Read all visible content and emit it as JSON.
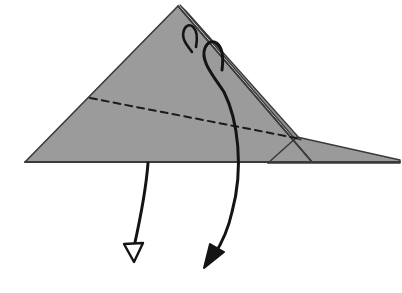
{
  "figure": {
    "type": "origami-fold-diagram",
    "canvas": {
      "width": 402,
      "height": 293
    },
    "background_color": "#ffffff"
  },
  "palette": {
    "paper_fill": "#9b9b9b",
    "paper_fill_flap": "#9a9a9a",
    "paper_fill_sliver": "#8c8c8c",
    "edge_stroke": "#3a3a3a",
    "crease_stroke": "#1a1a1a",
    "arrow_stroke": "#141414",
    "arrow_fill": "#141414",
    "background": "#ffffff"
  },
  "shapes": {
    "main_triangle": {
      "name": "Main folded triangle body",
      "points": "25,162 178,6 312,162",
      "fill_ref": "paper_fill",
      "stroke_ref": "edge_stroke",
      "stroke_width": 1.6
    },
    "right_flap": {
      "name": "Thin right-pointing flap layer",
      "points": "297,137 400,160 400,163 268,163",
      "fill_ref": "paper_fill_flap",
      "stroke_ref": "edge_stroke",
      "stroke_width": 1.4
    },
    "apex_sliver": {
      "name": "Narrow raised sliver along right upper edge",
      "points": "180,5 186,11 301,140 294,138",
      "fill_ref": "paper_fill_sliver",
      "stroke_ref": "edge_stroke",
      "stroke_width": 1.2
    }
  },
  "lines": {
    "baseline": {
      "name": "Bottom horizontal edge",
      "from": "25,162",
      "to": "400,162",
      "stroke_ref": "edge_stroke",
      "stroke_width": 1.8,
      "style": "solid"
    },
    "right_edge_fold": {
      "name": "Right edge fold line from apex to baseline",
      "from": "178,6",
      "to": "312,162",
      "stroke_ref": "edge_stroke",
      "stroke_width": 1.8,
      "style": "solid"
    },
    "flap_left_edge": {
      "name": "Left boundary of right flap",
      "from": "297,137",
      "to": "268,163",
      "stroke_ref": "edge_stroke",
      "stroke_width": 1.5,
      "style": "solid"
    },
    "crease_dashed": {
      "name": "Valley fold crease (dashed)",
      "from": "90,98",
      "to": "301,139",
      "stroke_ref": "crease_stroke",
      "stroke_width": 2.0,
      "style": "dashed",
      "dash_pattern": "7,5"
    }
  },
  "arrows": [
    {
      "id": "arrow-left-unfold",
      "name": "Left downward unfold arrow (hollow head)",
      "head_style": "hollow",
      "description": "Straight slightly curved arrow descending from the baseline down and to the left",
      "path": "M 148,163 C 146,190 140,220 134,247",
      "head_points": "134,262 124,244 143,243",
      "stroke_ref": "arrow_stroke",
      "stroke_width": 3.0
    },
    {
      "id": "arrow-right-fold",
      "name": "Right fold-over arrow wrapping the edge (solid head)",
      "head_style": "solid",
      "description": "Large arrow looping over the right folded edge near the apex and sweeping down to the lower middle",
      "path": "M 222,70 C 226,40 210,36 205,48 C 200,60 212,74 224,92 C 238,120 244,168 232,212 C 228,230 222,243 214,255",
      "head_points": "204,268 210,244 224,252",
      "stroke_ref": "arrow_stroke",
      "stroke_width": 3.0
    },
    {
      "id": "arrow-small-loop",
      "name": "Small loop arrow at apex wrapping the top edge",
      "head_style": "none",
      "description": "Short hook looping over the top right edge just below the apex",
      "path": "M 196,47 C 200,26 188,20 184,30 C 181,38 186,44 192,52",
      "stroke_ref": "arrow_stroke",
      "stroke_width": 2.6
    }
  ],
  "labels": {
    "caption": "",
    "step_number": ""
  }
}
